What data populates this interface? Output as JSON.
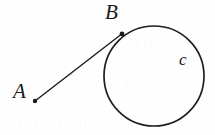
{
  "figure": {
    "canvas": {
      "width": 215,
      "height": 135,
      "background": "#fefefe"
    },
    "ink_color": "#1f1f1f",
    "labels": {
      "point_a": "A",
      "point_b": "B",
      "circle_c": "c"
    },
    "points": [
      {
        "id": "A",
        "label": "A",
        "x": 35,
        "y": 101,
        "dot_radius": 2.2
      },
      {
        "id": "B",
        "label": "B",
        "x": 122,
        "y": 34,
        "dot_radius": 2.4
      }
    ],
    "segment": {
      "name": "AB",
      "from": "A",
      "to": "B",
      "x1": 35,
      "y1": 101,
      "x2": 123,
      "y2": 33,
      "stroke_width": 1.5
    },
    "circle": {
      "name": "c",
      "cx": 154,
      "cy": 76,
      "r": 50,
      "stroke_width": 1.7,
      "fill": "none"
    },
    "label_positions": {
      "A": {
        "x": 20,
        "y": 94
      },
      "B": {
        "x": 113,
        "y": 15
      },
      "c": {
        "x": 186,
        "y": 61
      }
    }
  }
}
